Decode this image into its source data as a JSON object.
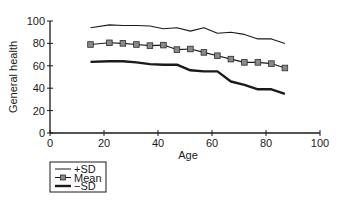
{
  "chart_data": {
    "type": "line",
    "title": "",
    "xlabel": "Age",
    "ylabel": "General health",
    "xlim": [
      0,
      100
    ],
    "ylim": [
      0,
      100
    ],
    "xticks": [
      0,
      20,
      40,
      60,
      80,
      100
    ],
    "yticks": [
      0,
      20,
      40,
      60,
      80,
      100
    ],
    "grid": false,
    "legend_position": "below-left",
    "x": [
      15,
      22,
      27,
      32,
      37,
      42,
      47,
      52,
      57,
      62,
      67,
      72,
      77,
      82,
      87
    ],
    "series": [
      {
        "name": "+SD",
        "style": "thin-line",
        "values": [
          94,
          96.5,
          96,
          96,
          95.5,
          93,
          94,
          91,
          94,
          89,
          90,
          88,
          84,
          84,
          80
        ]
      },
      {
        "name": "Mean",
        "style": "line-square-markers",
        "values": [
          79,
          80.5,
          80,
          79,
          78,
          78.5,
          74.5,
          75,
          72,
          69,
          66,
          63,
          63,
          62,
          58
        ]
      },
      {
        "name": "−SD",
        "style": "thick-line",
        "values": [
          63.5,
          64,
          64,
          63,
          61.5,
          61,
          61,
          56,
          55,
          55,
          46,
          43,
          39,
          39,
          35
        ]
      }
    ]
  },
  "legend": {
    "items": [
      {
        "label": "+SD"
      },
      {
        "label": "Mean"
      },
      {
        "label": "−SD"
      }
    ]
  },
  "colors": {
    "line": "#1a1a1a",
    "marker_fill": "#8a8a8a",
    "marker_stroke": "#2a2a2a"
  }
}
